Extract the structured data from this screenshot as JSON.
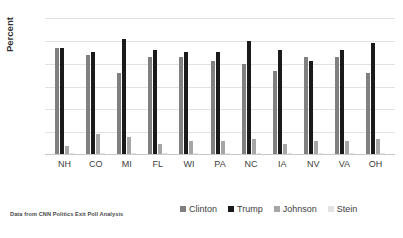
{
  "chart_data": {
    "type": "bar",
    "title": "",
    "xlabel": "",
    "ylabel": "Percent",
    "ylim": [
      0,
      60
    ],
    "yticks": [
      0,
      10,
      20,
      30,
      40,
      50,
      60
    ],
    "grid": true,
    "legend_position": "bottom",
    "categories": [
      "NH",
      "CO",
      "MI",
      "FL",
      "WI",
      "PA",
      "NC",
      "IA",
      "NV",
      "VA",
      "OH"
    ],
    "series": [
      {
        "name": "Clinton",
        "color": "#808080",
        "values": [
          47,
          44,
          36,
          43,
          43,
          41,
          40,
          37,
          43,
          43,
          36
        ]
      },
      {
        "name": "Trump",
        "color": "#1a1a1a",
        "values": [
          47,
          45,
          51,
          46,
          45,
          45,
          50,
          46,
          41,
          46,
          49
        ]
      },
      {
        "name": "Johnson",
        "color": "#a6a6a6",
        "values": [
          4,
          9,
          8,
          5,
          6,
          6,
          7,
          5,
          6,
          6,
          7
        ]
      },
      {
        "name": "Stein",
        "color": "#e2e2e2",
        "values": [
          1,
          1,
          1,
          1,
          1,
          1,
          1,
          1,
          1,
          1,
          1
        ]
      }
    ]
  },
  "caption": {
    "text": "Data from CNN Politics Exit Poll Analysis"
  }
}
